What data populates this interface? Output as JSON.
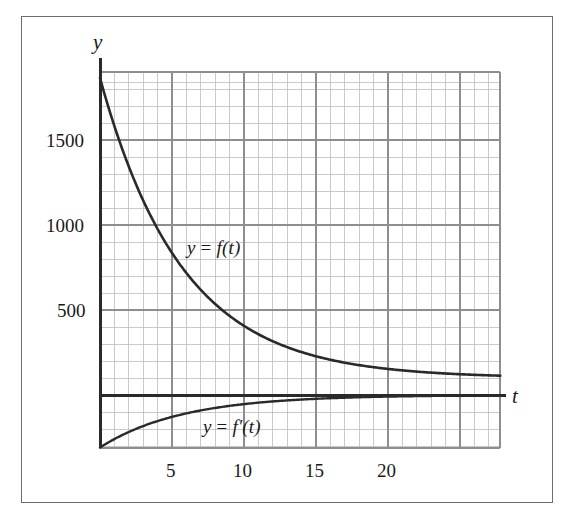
{
  "figure": {
    "border_color": "#6d6d6d",
    "background": "#ffffff"
  },
  "axes": {
    "y_axis_name": "y",
    "x_axis_name": "t",
    "y_ticks": [
      {
        "value": 500,
        "label": "500"
      },
      {
        "value": 1000,
        "label": "1000"
      },
      {
        "value": 1500,
        "label": "1500"
      }
    ],
    "x_ticks": [
      {
        "value": 5,
        "label": "5"
      },
      {
        "value": 10,
        "label": "10"
      },
      {
        "value": 15,
        "label": "15"
      },
      {
        "value": 20,
        "label": "20"
      }
    ],
    "grid": {
      "minor_color": "#b9b9bd",
      "major_color": "#8f8f96",
      "minor_step_x": 1,
      "major_step_x": 5,
      "minor_step_y": 100,
      "major_step_y": 500,
      "visible": true
    },
    "axis_line_color": "#2a2a2a"
  },
  "labels": {
    "f_label_parts": {
      "lhs": "y",
      "op": " = ",
      "rhs": "f(t)"
    },
    "fp_label_parts": {
      "lhs": "y",
      "op": " = ",
      "rhs": "f′(t)"
    },
    "f_label_text": "y = f(t)",
    "fp_label_text": "y = f′(t)"
  },
  "chart_data": {
    "type": "line",
    "title": "",
    "xlabel": "t",
    "ylabel": "y",
    "xlim": [
      0,
      27.8
    ],
    "ylim": [
      -370,
      2010
    ],
    "grid": true,
    "legend": "inline-annotations",
    "curve_color": "#2a2a2a",
    "series": [
      {
        "name": "y = f(t)",
        "label_text": "y = f(t)",
        "label_at": {
          "t": 6.1,
          "y": 880
        },
        "model": "A*exp(-k*t) + C",
        "params": {
          "A": 1765,
          "k": 0.175,
          "C": 100
        },
        "x": [
          0,
          1,
          2,
          3,
          4,
          5,
          6,
          7,
          8,
          9,
          10,
          11,
          12,
          13,
          14,
          15,
          16,
          17,
          18,
          19,
          20,
          21,
          22,
          23,
          24,
          25,
          26,
          27,
          27.8
        ],
        "y": [
          1865,
          1582,
          1344,
          1145,
          976,
          835,
          716,
          616,
          532,
          461,
          402,
          352,
          310,
          275,
          245,
          220,
          199,
          181,
          166,
          153,
          143,
          134,
          126,
          120,
          115,
          111,
          107,
          104,
          102
        ]
      },
      {
        "name": "y = f'(t)",
        "label_text": "y = f′(t)",
        "label_at": {
          "t": 7.9,
          "y": -195
        },
        "model": "-A*k*exp(-k*t)",
        "params": {
          "A": 1765,
          "k": 0.175
        },
        "x": [
          0,
          1,
          2,
          3,
          4,
          5,
          6,
          7,
          8,
          9,
          10,
          11,
          12,
          13,
          14,
          15,
          16,
          17,
          18,
          19,
          20,
          21,
          22,
          23,
          24,
          25,
          26,
          27,
          27.8
        ],
        "y": [
          -309,
          -259,
          -218,
          -183,
          -153,
          -129,
          -108,
          -91,
          -76,
          -64,
          -54,
          -45,
          -38,
          -32,
          -27,
          -22,
          -19,
          -16,
          -13,
          -11,
          -9,
          -8,
          -6,
          -5,
          -5,
          -4,
          -3,
          -3,
          -2
        ]
      }
    ]
  },
  "geometry": {
    "plot_left_px": 100,
    "plot_right_px": 500,
    "plot_top_px": 72,
    "plot_bottom_px": 448,
    "zero_y_px": 395,
    "px_per_unit_x": 14.4,
    "px_per_500_y": 85,
    "y_axis_top_px": 58,
    "t_axis_right_px": 506
  }
}
